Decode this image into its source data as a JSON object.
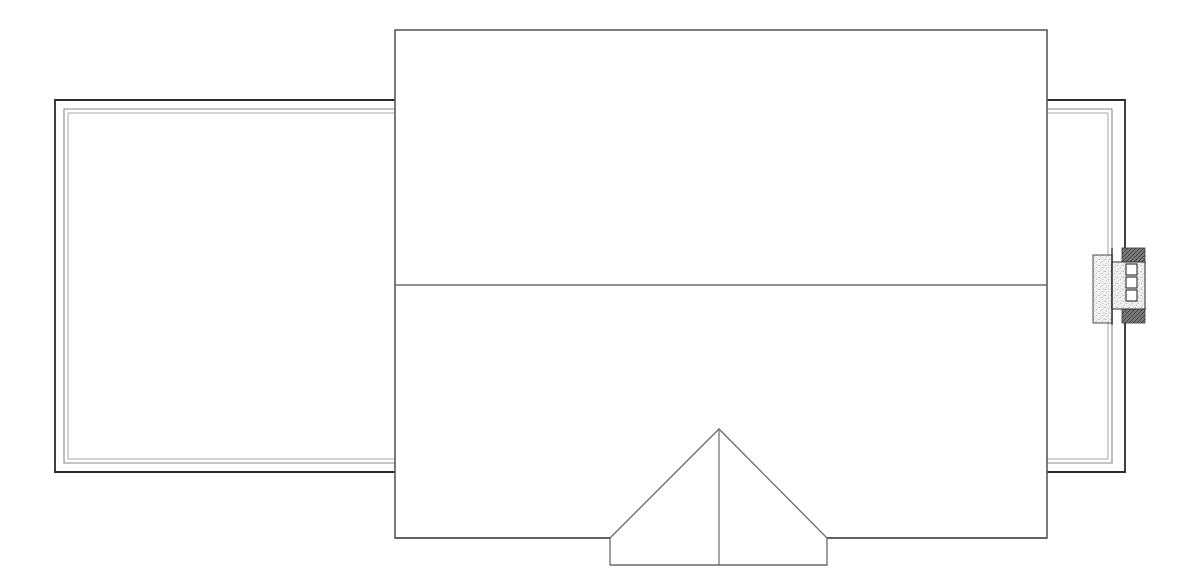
{
  "document": {
    "kind": "architectural-roof-plan",
    "background_color": "#ffffff",
    "width": 1200,
    "height": 588,
    "line_color": "#555555",
    "line_color_dark": "#1a1a1a",
    "hatch_color": "#666666"
  },
  "main_roof": {
    "name": "main-roof-body",
    "x": 395,
    "y": 30,
    "width": 652,
    "height": 508,
    "ridge_y": 285,
    "stroke": "#5a5a5a",
    "stroke_width": 1.6,
    "fill": "#ffffff"
  },
  "ridge_line": {
    "name": "roof-ridge-line",
    "x1": 395,
    "y1": 285,
    "x2": 1047,
    "y2": 285,
    "stroke": "#6e6e6e",
    "stroke_width": 1.3
  },
  "left_deck": {
    "name": "left-deck-outline",
    "outer": {
      "x": 55,
      "y": 100,
      "width": 341,
      "height": 372
    },
    "inner": {
      "x": 64,
      "y": 109,
      "width": 332,
      "height": 354
    },
    "stroke_outer": "#2b2b2b",
    "stroke_inner": "#8a8a8a",
    "stroke_width_outer": 1.8,
    "stroke_width_inner": 1.1,
    "fill": "#ffffff",
    "open_side": "right"
  },
  "right_deck": {
    "name": "right-deck-outline",
    "outer": {
      "x": 1047,
      "y": 100,
      "width": 78,
      "height": 372
    },
    "inner": {
      "x": 1047,
      "y": 109,
      "width": 65,
      "height": 354
    },
    "stroke_outer": "#2b2b2b",
    "stroke_inner": "#8a8a8a",
    "stroke_width_outer": 1.8,
    "stroke_width_inner": 1.1,
    "fill": "#ffffff",
    "open_side": "left"
  },
  "porch": {
    "name": "front-porch-gable",
    "apex_x": 719,
    "apex_y": 429,
    "eave_left_x": 610,
    "eave_right_x": 827,
    "eave_y": 538,
    "base_y": 565,
    "stroke": "#6a6a6a",
    "stroke_width": 1.3,
    "fill": "#ffffff",
    "center_line": {
      "x1": 719,
      "y1": 429,
      "x2": 719,
      "y2": 565
    }
  },
  "wall_detail": {
    "name": "exterior-wall-detail-callout",
    "label": "wall section detail",
    "left_block": {
      "x": 1093,
      "y": 255,
      "width": 18,
      "height": 68
    },
    "right_block": {
      "x": 1105,
      "y": 248,
      "width": 40,
      "height": 76
    },
    "hatch_bands": [
      {
        "x": 1122,
        "y": 248,
        "width": 23,
        "height": 15
      },
      {
        "x": 1122,
        "y": 308,
        "width": 23,
        "height": 15
      }
    ],
    "squares": [
      {
        "x": 1126,
        "y": 264,
        "size": 11
      },
      {
        "x": 1126,
        "y": 277,
        "size": 11
      },
      {
        "x": 1126,
        "y": 290,
        "size": 11
      }
    ],
    "stipple_fill": "#ededed",
    "hatch_fill": "#6b6b6b",
    "stroke": "#2f2f2f",
    "stroke_width": 1.0,
    "square_count": 3
  },
  "legend": {
    "title": "",
    "notes": []
  }
}
